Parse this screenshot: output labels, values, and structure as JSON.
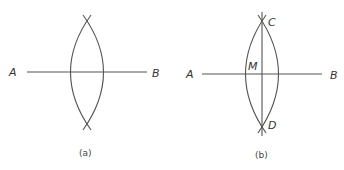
{
  "figures": [
    {
      "id": "a",
      "caption": "(a)",
      "points": {
        "A": "A",
        "B": "B"
      },
      "description": "Segment AB with two intersecting arcs drawn from A and B, crossing above and below the segment"
    },
    {
      "id": "b",
      "caption": "(b)",
      "points": {
        "A": "A",
        "B": "B",
        "C": "C",
        "D": "D",
        "M": "M"
      },
      "description": "Segment AB with arcs intersecting at C and D; line CD is the perpendicular bisector meeting AB at midpoint M"
    }
  ],
  "colors": {
    "stroke": "#555555",
    "text": "#333333"
  }
}
